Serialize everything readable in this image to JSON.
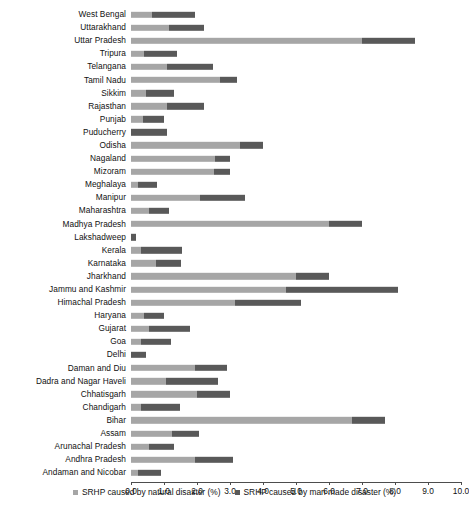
{
  "chart_data": {
    "type": "bar",
    "subtype": "stacked-horizontal",
    "title": "",
    "xlabel": "",
    "ylabel": "",
    "xlim": [
      0.0,
      10.0
    ],
    "xticks": [
      "0.0",
      "1.0",
      "2.0",
      "3.0",
      "4.0",
      "5.0",
      "6.0",
      "7.0",
      "8.0",
      "9.0",
      "10.0"
    ],
    "grid": false,
    "legend_position": "bottom",
    "categories": [
      "West Bengal",
      "Uttarakhand",
      "Uttar Pradesh",
      "Tripura",
      "Telangana",
      "Tamil Nadu",
      "Sikkim",
      "Rajasthan",
      "Punjab",
      "Puducherry",
      "Odisha",
      "Nagaland",
      "Mizoram",
      "Meghalaya",
      "Manipur",
      "Maharashtra",
      "Madhya Pradesh",
      "Lakshadweep",
      "Kerala",
      "Karnataka",
      "Jharkhand",
      "Jammu and Kashmir",
      "Himachal Pradesh",
      "Haryana",
      "Gujarat",
      "Goa",
      "Delhi",
      "Daman and Diu",
      "Dadra and Nagar Haveli",
      "Chhatisgarh",
      "Chandigarh",
      "Bihar",
      "Assam",
      "Arunachal Pradesh",
      "Andhra Pradesh",
      "Andaman and Nicobar"
    ],
    "series": [
      {
        "name": "SRHP caused by natural disaster (%)",
        "color": "#a6a6a6",
        "values": [
          0.65,
          1.15,
          7.0,
          0.4,
          1.1,
          2.7,
          0.45,
          1.1,
          0.35,
          0.0,
          3.3,
          2.55,
          2.5,
          0.2,
          2.1,
          0.55,
          6.0,
          0.0,
          0.3,
          0.75,
          5.0,
          4.7,
          3.15,
          0.4,
          0.55,
          0.3,
          0.0,
          1.95,
          1.05,
          2.0,
          0.3,
          6.7,
          1.25,
          0.55,
          1.95,
          0.2
        ]
      },
      {
        "name": "SRHP caused by man made disaster (%)",
        "color": "#595959",
        "values": [
          1.3,
          1.05,
          1.6,
          1.0,
          1.4,
          0.5,
          0.85,
          1.1,
          0.65,
          1.1,
          0.7,
          0.45,
          0.5,
          0.6,
          1.35,
          0.6,
          1.0,
          0.15,
          1.25,
          0.75,
          1.0,
          3.4,
          2.0,
          0.6,
          1.25,
          0.9,
          0.45,
          0.95,
          1.6,
          1.0,
          1.2,
          1.0,
          0.8,
          0.75,
          1.15,
          0.7
        ]
      }
    ]
  },
  "legend": {
    "items": [
      {
        "label": "SRHP caused by natural disaster (%)",
        "color": "#a6a6a6"
      },
      {
        "label": "SRHP caused by man made disaster (%)",
        "color": "#595959"
      }
    ]
  }
}
